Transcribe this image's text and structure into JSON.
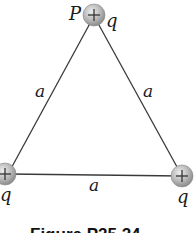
{
  "figure": {
    "caption": "Figure P25.24",
    "side_label": "a",
    "charges": [
      {
        "id": "top",
        "sign": "+",
        "label": "q",
        "point_label": "P"
      },
      {
        "id": "bottom-left",
        "sign": "+",
        "label": "q"
      },
      {
        "id": "bottom-right",
        "sign": "+",
        "label": "q"
      }
    ],
    "sides": [
      {
        "id": "left",
        "label": "a"
      },
      {
        "id": "right",
        "label": "a"
      },
      {
        "id": "bottom",
        "label": "a"
      }
    ],
    "colors": {
      "line": "#3a3a3a",
      "charge_fill": "#b5b5b5",
      "charge_edge": "#8a8a8a"
    }
  }
}
